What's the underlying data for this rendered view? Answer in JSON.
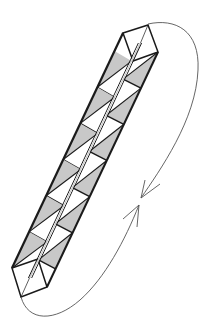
{
  "figure": {
    "title": "",
    "width": 210,
    "height": 333
  },
  "colors": {
    "background": "#ffffff",
    "stroke": "#1a1a1a",
    "shade": "#c8c8c8",
    "arrow": "#555555"
  },
  "strip": {
    "outer_left": [
      [
        123,
        33
      ],
      [
        12,
        268
      ]
    ],
    "middle": [
      [
        140,
        43
      ],
      [
        30,
        278
      ]
    ],
    "outer_right": [
      [
        158,
        52
      ],
      [
        47,
        287
      ]
    ],
    "top_cap": [
      [
        123,
        33
      ],
      [
        148,
        25
      ],
      [
        158,
        52
      ],
      [
        133,
        61
      ]
    ],
    "top_cap_diagonal": [
      [
        148,
        25
      ],
      [
        133,
        61
      ]
    ],
    "bottom_cap": [
      [
        12,
        268
      ],
      [
        38,
        259
      ],
      [
        47,
        287
      ],
      [
        21,
        297
      ]
    ],
    "bottom_cap_diagonal": [
      [
        38,
        259
      ],
      [
        21,
        297
      ]
    ],
    "cells_per_face": 6
  },
  "arrows": [
    {
      "name": "upper-arc",
      "path": "M148 24 C 175 18, 200 30, 198 70 C 196 120, 160 170, 141 198",
      "tip": [
        141,
        198
      ],
      "barbs": [
        [
          160,
          184
        ],
        [
          145,
          180
        ]
      ]
    },
    {
      "name": "lower-arc",
      "path": "M21 297 C 28 322, 55 322, 80 300 C 105 278, 125 240, 139 205",
      "tip": [
        139,
        205
      ],
      "barbs": [
        [
          123,
          219
        ],
        [
          137,
          227
        ]
      ]
    }
  ]
}
